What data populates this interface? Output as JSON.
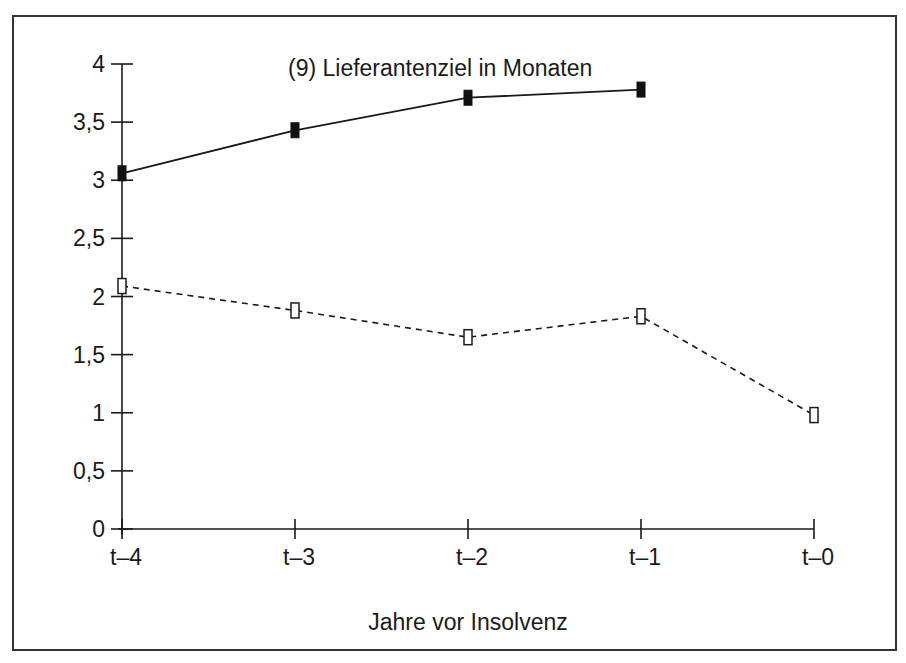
{
  "chart_data": {
    "type": "line",
    "title": "(9) Lieferantenziel in Monaten",
    "xlabel": "Jahre vor Insolvenz",
    "ylabel": "",
    "categories": [
      "t–4",
      "t–3",
      "t–2",
      "t–1",
      "t–0"
    ],
    "ylim": [
      0,
      4
    ],
    "yticks": [
      0,
      0.5,
      1,
      1.5,
      2,
      2.5,
      3,
      3.5,
      4
    ],
    "ytick_labels": [
      "0",
      "0,5",
      "1",
      "1,5",
      "2",
      "2,5",
      "3",
      "3,5",
      "4"
    ],
    "grid": false,
    "legend": null,
    "series": [
      {
        "name": "filled-markers-solid-line",
        "style": "solid",
        "marker": "filled-rect",
        "values": [
          3.06,
          3.43,
          3.71,
          3.78,
          null
        ]
      },
      {
        "name": "open-markers-dashed-line",
        "style": "dashed",
        "marker": "open-rect",
        "values": [
          2.09,
          1.88,
          1.65,
          1.83,
          0.98
        ]
      }
    ]
  },
  "colors": {
    "ink": "#1a1a1a",
    "background": "#ffffff",
    "frame": "#333333"
  }
}
